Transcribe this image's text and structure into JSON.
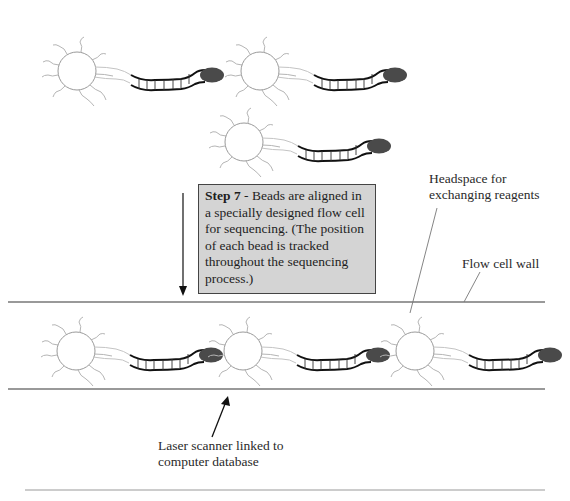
{
  "diagram": {
    "step_box": {
      "step_label": "Step 7",
      "separator": " - ",
      "text": "Beads are aligned in a specially designed flow cell for sequencing. (The position of each bead is tracked throughout the sequencing process.)"
    },
    "labels": {
      "headspace": "Headspace for exchanging reagents",
      "headspace_line1": "Headspace for",
      "headspace_line2": "exchanging reagents",
      "flow_cell_wall": "Flow cell wall",
      "laser_line1": "Laser scanner linked to",
      "laser_line2": "computer database"
    },
    "colors": {
      "box_fill": "#d4d4d4",
      "bead_outline": "#999999",
      "tail_ink": "#111111",
      "tip_fill": "#4a4a4a",
      "wall_line": "#777777"
    },
    "beads_free": [
      {
        "cx": 77,
        "cy": 71
      },
      {
        "cx": 260,
        "cy": 71
      },
      {
        "cx": 244,
        "cy": 142
      }
    ],
    "beads_in_flow_cell": [
      {
        "cx": 76,
        "cy": 351
      },
      {
        "cx": 243,
        "cy": 351
      },
      {
        "cx": 415,
        "cy": 351
      }
    ]
  }
}
